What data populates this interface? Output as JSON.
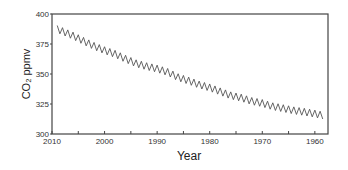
{
  "chart_data": {
    "type": "line",
    "title": "",
    "xlabel": "Year",
    "ylabel": "CO₂ ppmv",
    "x_reversed": true,
    "xlim": [
      2010,
      1957.5
    ],
    "ylim": [
      300,
      400
    ],
    "x_ticks": [
      2010,
      2005,
      2000,
      1995,
      1990,
      1985,
      1980,
      1975,
      1970,
      1965,
      1960
    ],
    "x_tick_labels": [
      "2010",
      "",
      "2000",
      "",
      "1990",
      "",
      "1980",
      "",
      "1970",
      "",
      "1960"
    ],
    "y_ticks": [
      300,
      325,
      350,
      375,
      400
    ],
    "y_tick_labels": [
      "300",
      "325",
      "350",
      "375",
      "400"
    ],
    "grid": false,
    "legend": null,
    "series": [
      {
        "name": "CO2 (seasonal cycle)",
        "color": "#555555",
        "seasonal_amplitude": 3,
        "x": [
          1958.5,
          1960,
          1962,
          1964,
          1966,
          1968,
          1970,
          1972,
          1974,
          1976,
          1978,
          1980,
          1982,
          1984,
          1986,
          1988,
          1990,
          1992,
          1994,
          1996,
          1998,
          2000,
          2002,
          2004,
          2006,
          2008,
          2009
        ],
        "values": [
          315.5,
          316.9,
          318.4,
          319.6,
          321.4,
          323.0,
          325.7,
          327.4,
          330.2,
          332.1,
          335.4,
          338.7,
          341.1,
          344.4,
          347.2,
          351.6,
          354.4,
          356.4,
          358.8,
          362.6,
          366.7,
          369.7,
          373.3,
          377.5,
          381.9,
          385.6,
          387.4
        ]
      }
    ]
  }
}
